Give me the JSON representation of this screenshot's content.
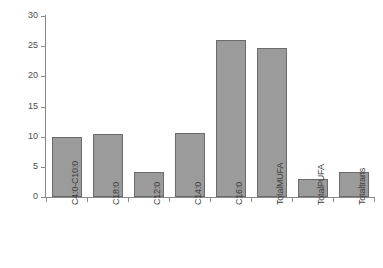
{
  "chart_data": {
    "type": "bar",
    "title": "",
    "subtitle": "",
    "xlabel": "",
    "ylabel": "",
    "ylim": [
      0,
      30
    ],
    "yticks": [
      0,
      5,
      10,
      15,
      20,
      25,
      30
    ],
    "grid": false,
    "legend": false,
    "legend_position": "none",
    "orientation": "vertical",
    "bar_color": "#9b9b9b",
    "bar_edge_color": "#6b6b6b",
    "axis_color": "#8a8a8a",
    "background": "#ffffff",
    "xtick_rotation": 90,
    "categories": [
      "C4:0-C10:0",
      "C18:0",
      "C12:0",
      "C14:0",
      "C16:0",
      "TotalMUFA",
      "TotalPUFA",
      "Totaltrans"
    ],
    "values": [
      10.0,
      10.5,
      4.2,
      10.6,
      26.1,
      24.7,
      3.0,
      4.1
    ]
  },
  "axes": {
    "y_tick_labels": [
      "0",
      "5",
      "10",
      "15",
      "20",
      "25",
      "30"
    ]
  }
}
